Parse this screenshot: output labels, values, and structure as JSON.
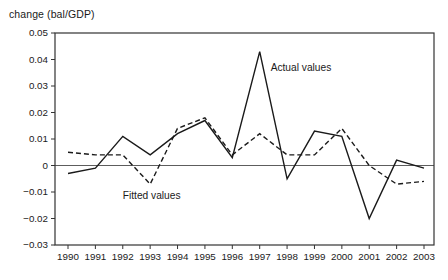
{
  "chart_data": {
    "type": "line",
    "title": "change (bal/GDP)",
    "x": [
      1990,
      1991,
      1992,
      1993,
      1994,
      1995,
      1996,
      1997,
      1998,
      1999,
      2000,
      2001,
      2002,
      2003
    ],
    "xtick_labels": [
      "1990",
      "1991",
      "1992",
      "1993",
      "1994",
      "1995",
      "1996",
      "1997",
      "1998",
      "1999",
      "2000",
      "2001",
      "2002",
      "2003"
    ],
    "series": [
      {
        "name": "Actual values",
        "line_style": "solid",
        "values": [
          -0.003,
          -0.001,
          0.011,
          0.004,
          0.012,
          0.017,
          0.003,
          0.043,
          -0.005,
          0.013,
          0.011,
          -0.02,
          0.002,
          -0.001
        ]
      },
      {
        "name": "Fitted values",
        "line_style": "dashed",
        "values": [
          0.005,
          0.004,
          0.004,
          -0.007,
          0.014,
          0.018,
          0.004,
          0.012,
          0.004,
          0.004,
          0.014,
          0.0,
          -0.007,
          -0.006
        ]
      }
    ],
    "ylim": [
      -0.03,
      0.05
    ],
    "yticks": [
      {
        "value": 0.05,
        "label": "0.05"
      },
      {
        "value": 0.04,
        "label": "0.04"
      },
      {
        "value": 0.03,
        "label": "0.03"
      },
      {
        "value": 0.02,
        "label": "0.02"
      },
      {
        "value": 0.01,
        "label": "0.01"
      },
      {
        "value": 0,
        "label": "0"
      },
      {
        "value": -0.01,
        "label": "−0.01"
      },
      {
        "value": -0.02,
        "label": "−0.02"
      },
      {
        "value": -0.03,
        "label": "−0.03"
      }
    ],
    "zero_line": true,
    "grid": false,
    "legend_position": "inline-annotations",
    "annotations": [
      {
        "text": "Actual values",
        "x_year": 1997.4,
        "y_value": 0.037
      },
      {
        "text": "Fitted values",
        "x_year": 1992.0,
        "y_value": -0.0115
      }
    ],
    "line_color": "#1a1a1a",
    "frame_color": "#333333",
    "text_color": "#1a1a1a",
    "background": "#ffffff"
  }
}
